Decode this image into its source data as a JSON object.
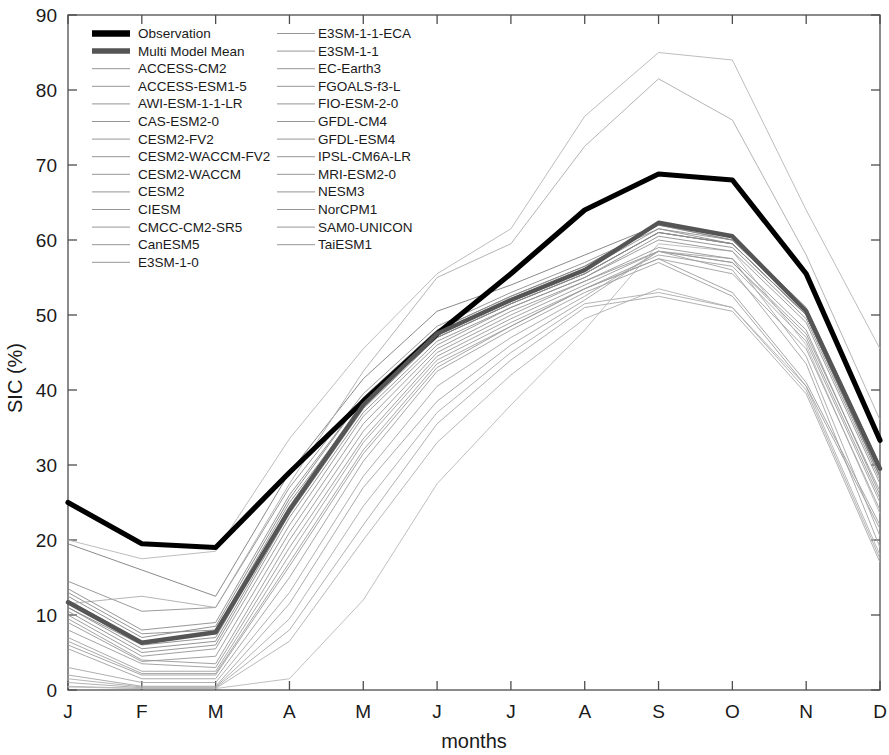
{
  "chart_data": {
    "type": "line",
    "title": "",
    "xlabel": "months",
    "ylabel": "SIC (%)",
    "categories": [
      "J",
      "F",
      "M",
      "A",
      "M",
      "J",
      "J",
      "A",
      "S",
      "O",
      "N",
      "D"
    ],
    "xtick_labels": [
      "J",
      "F",
      "M",
      "A",
      "M",
      "J",
      "J",
      "A",
      "S",
      "O",
      "N",
      "D"
    ],
    "ytick_labels": [
      "0",
      "10",
      "20",
      "30",
      "40",
      "50",
      "60",
      "70",
      "80",
      "90"
    ],
    "yticks": [
      0,
      10,
      20,
      30,
      40,
      50,
      60,
      70,
      80,
      90
    ],
    "ylim": [
      0,
      90
    ],
    "xlim": [
      0,
      11
    ],
    "grid": false,
    "legend_position": "upper-left-inside",
    "legend_columns": 2,
    "colors": {
      "observation": "#000000",
      "multi_model_mean": "#555555",
      "model_line": "#8a8a8a",
      "axis": "#4d4d4d",
      "background": "#ffffff"
    },
    "series": [
      {
        "name": "Observation",
        "kind": "observation",
        "color": "#000000",
        "width": 5.2,
        "values": [
          25.0,
          19.5,
          19.0,
          29.0,
          38.5,
          47.5,
          55.5,
          64.0,
          68.8,
          68.0,
          55.5,
          33.3
        ]
      },
      {
        "name": "Multi Model Mean",
        "kind": "mean",
        "color": "#555555",
        "width": 4.4,
        "values": [
          11.7,
          6.3,
          7.7,
          24.0,
          38.0,
          47.5,
          52.0,
          56.0,
          62.3,
          60.5,
          50.5,
          29.5
        ]
      },
      {
        "name": "ACCESS-CM2",
        "kind": "model",
        "color": "#7d7d7d",
        "width": 0.9,
        "values": [
          19.5,
          16.0,
          12.5,
          29.0,
          41.5,
          50.5,
          54.0,
          58.0,
          62.0,
          60.5,
          51.0,
          30.0
        ]
      },
      {
        "name": "ACCESS-ESM1-5",
        "kind": "model",
        "color": "#8f8f8f",
        "width": 0.9,
        "values": [
          14.5,
          10.5,
          11.0,
          27.0,
          39.5,
          48.5,
          53.0,
          57.0,
          61.5,
          59.5,
          50.0,
          28.5
        ]
      },
      {
        "name": "AWI-ESM-1-1-LR",
        "kind": "model",
        "color": "#999999",
        "width": 0.9,
        "values": [
          9.5,
          4.0,
          3.5,
          20.0,
          34.5,
          45.0,
          50.0,
          54.5,
          58.5,
          57.0,
          47.5,
          26.5
        ]
      },
      {
        "name": "CAS-ESM2-0",
        "kind": "model",
        "color": "#a3a3a3",
        "width": 0.9,
        "values": [
          2.0,
          0.5,
          0.5,
          11.5,
          27.0,
          38.5,
          46.0,
          52.0,
          58.5,
          56.0,
          43.5,
          19.0
        ]
      },
      {
        "name": "CESM2-FV2",
        "kind": "model",
        "color": "#8a8a8a",
        "width": 0.9,
        "values": [
          13.0,
          7.5,
          8.0,
          25.0,
          38.0,
          47.0,
          51.5,
          55.5,
          61.0,
          59.5,
          50.0,
          28.5
        ]
      },
      {
        "name": "CESM2-WACCM-FV2",
        "kind": "model",
        "color": "#909090",
        "width": 0.9,
        "values": [
          12.0,
          6.5,
          7.5,
          24.5,
          38.5,
          47.5,
          52.0,
          56.0,
          61.5,
          60.0,
          50.5,
          29.0
        ]
      },
      {
        "name": "CESM2-WACCM",
        "kind": "model",
        "color": "#878787",
        "width": 0.9,
        "values": [
          11.0,
          5.5,
          6.5,
          23.5,
          37.5,
          47.0,
          51.5,
          55.5,
          61.0,
          59.5,
          50.0,
          28.5
        ]
      },
      {
        "name": "CESM2",
        "kind": "model",
        "color": "#8d8d8d",
        "width": 0.9,
        "values": [
          10.5,
          5.0,
          6.0,
          23.0,
          37.0,
          46.5,
          51.0,
          55.0,
          60.5,
          59.0,
          49.5,
          28.0
        ]
      },
      {
        "name": "CIESM",
        "kind": "model",
        "color": "#9c9c9c",
        "width": 0.9,
        "values": [
          6.0,
          2.0,
          2.0,
          16.5,
          31.5,
          43.0,
          48.5,
          53.5,
          57.5,
          53.0,
          41.0,
          22.0
        ]
      },
      {
        "name": "CMCC-CM2-SR5",
        "kind": "model",
        "color": "#848484",
        "width": 0.9,
        "values": [
          12.5,
          7.0,
          8.5,
          25.5,
          39.0,
          48.0,
          52.5,
          56.5,
          62.0,
          60.0,
          50.5,
          29.5
        ]
      },
      {
        "name": "CanESM5",
        "kind": "model",
        "color": "#a8a8a8",
        "width": 0.9,
        "values": [
          1.0,
          0.3,
          0.3,
          8.0,
          22.0,
          35.5,
          44.0,
          51.0,
          52.5,
          50.5,
          39.5,
          17.0
        ]
      },
      {
        "name": "E3SM-1-0",
        "kind": "model",
        "color": "#b0b0b0",
        "width": 0.9,
        "values": [
          0.5,
          0.2,
          0.2,
          6.5,
          20.0,
          33.0,
          42.0,
          49.5,
          53.5,
          51.0,
          40.5,
          18.0
        ]
      },
      {
        "name": "E3SM-1-1-ECA",
        "kind": "model",
        "color": "#b5b5b5",
        "width": 0.9,
        "values": [
          20.0,
          17.5,
          18.5,
          33.5,
          45.5,
          55.5,
          61.5,
          76.5,
          85.0,
          84.0,
          64.0,
          45.5
        ]
      },
      {
        "name": "E3SM-1-1",
        "kind": "model",
        "color": "#acacac",
        "width": 0.9,
        "values": [
          11.5,
          12.5,
          11.0,
          27.5,
          42.5,
          55.0,
          59.5,
          72.5,
          81.5,
          76.0,
          58.0,
          36.0
        ]
      },
      {
        "name": "EC-Earth3",
        "kind": "model",
        "color": "#9a9a9a",
        "width": 0.9,
        "values": [
          8.0,
          3.5,
          3.0,
          19.0,
          33.5,
          44.5,
          49.5,
          54.0,
          58.5,
          57.0,
          47.0,
          25.5
        ]
      },
      {
        "name": "FGOALS-f3-L",
        "kind": "model",
        "color": "#a0a0a0",
        "width": 0.9,
        "values": [
          7.0,
          2.5,
          2.5,
          18.0,
          33.0,
          44.0,
          49.0,
          53.5,
          58.0,
          56.5,
          46.5,
          25.0
        ]
      },
      {
        "name": "FIO-ESM-2-0",
        "kind": "model",
        "color": "#b8b8b8",
        "width": 0.9,
        "values": [
          0.4,
          0.2,
          0.2,
          1.5,
          12.0,
          27.5,
          38.0,
          48.0,
          59.5,
          58.5,
          46.0,
          23.5
        ]
      },
      {
        "name": "GFDL-CM4",
        "kind": "model",
        "color": "#9e9e9e",
        "width": 0.9,
        "values": [
          5.5,
          1.5,
          1.5,
          15.0,
          30.5,
          42.5,
          48.0,
          53.0,
          57.0,
          52.5,
          40.5,
          21.5
        ]
      },
      {
        "name": "GFDL-ESM4",
        "kind": "model",
        "color": "#8b8b8b",
        "width": 0.9,
        "values": [
          13.5,
          8.0,
          9.0,
          26.0,
          39.0,
          48.0,
          52.5,
          56.5,
          62.0,
          60.0,
          50.5,
          29.5
        ]
      },
      {
        "name": "IPSL-CM6A-LR",
        "kind": "model",
        "color": "#949494",
        "width": 0.9,
        "values": [
          10.0,
          4.5,
          5.5,
          22.0,
          36.5,
          46.0,
          51.0,
          55.0,
          60.0,
          58.5,
          49.0,
          27.5
        ]
      },
      {
        "name": "MRI-ESM2-0",
        "kind": "model",
        "color": "#a6a6a6",
        "width": 0.9,
        "values": [
          3.0,
          1.0,
          1.0,
          13.0,
          28.5,
          40.5,
          47.0,
          52.5,
          58.5,
          57.5,
          44.5,
          20.5
        ]
      },
      {
        "name": "NESM3",
        "kind": "model",
        "color": "#ababab",
        "width": 0.9,
        "values": [
          1.5,
          0.4,
          0.4,
          9.5,
          24.5,
          37.0,
          45.0,
          51.5,
          53.0,
          51.0,
          40.0,
          17.5
        ]
      },
      {
        "name": "NorCPM1",
        "kind": "model",
        "color": "#898989",
        "width": 0.9,
        "values": [
          11.0,
          6.0,
          7.0,
          24.0,
          38.0,
          47.0,
          51.5,
          55.5,
          61.0,
          59.5,
          50.0,
          28.5
        ]
      },
      {
        "name": "SAM0-UNICON",
        "kind": "model",
        "color": "#9f9f9f",
        "width": 0.9,
        "values": [
          6.5,
          2.2,
          2.2,
          17.0,
          32.0,
          43.5,
          48.5,
          53.5,
          57.5,
          55.5,
          45.5,
          24.0
        ]
      },
      {
        "name": "TaiESM1",
        "kind": "model",
        "color": "#969696",
        "width": 0.9,
        "values": [
          9.0,
          3.8,
          4.5,
          21.0,
          35.5,
          45.5,
          50.5,
          54.5,
          59.0,
          57.5,
          48.0,
          26.0
        ]
      }
    ]
  },
  "legend": {
    "column1": [
      {
        "label": "Observation",
        "style": "thick-black"
      },
      {
        "label": "Multi Model Mean",
        "style": "thick-gray"
      },
      {
        "label": "ACCESS-CM2",
        "style": "thin"
      },
      {
        "label": "ACCESS-ESM1-5",
        "style": "thin"
      },
      {
        "label": "AWI-ESM-1-1-LR",
        "style": "thin"
      },
      {
        "label": "CAS-ESM2-0",
        "style": "thin"
      },
      {
        "label": "CESM2-FV2",
        "style": "thin"
      },
      {
        "label": "CESM2-WACCM-FV2",
        "style": "thin"
      },
      {
        "label": "CESM2-WACCM",
        "style": "thin"
      },
      {
        "label": "CESM2",
        "style": "thin"
      },
      {
        "label": "CIESM",
        "style": "thin"
      },
      {
        "label": "CMCC-CM2-SR5",
        "style": "thin"
      },
      {
        "label": "CanESM5",
        "style": "thin"
      },
      {
        "label": "E3SM-1-0",
        "style": "thin"
      }
    ],
    "column2": [
      {
        "label": "E3SM-1-1-ECA",
        "style": "thin"
      },
      {
        "label": "E3SM-1-1",
        "style": "thin"
      },
      {
        "label": "EC-Earth3",
        "style": "thin"
      },
      {
        "label": "FGOALS-f3-L",
        "style": "thin"
      },
      {
        "label": "FIO-ESM-2-0",
        "style": "thin"
      },
      {
        "label": "GFDL-CM4",
        "style": "thin"
      },
      {
        "label": "GFDL-ESM4",
        "style": "thin"
      },
      {
        "label": "IPSL-CM6A-LR",
        "style": "thin"
      },
      {
        "label": "MRI-ESM2-0",
        "style": "thin"
      },
      {
        "label": "NESM3",
        "style": "thin"
      },
      {
        "label": "NorCPM1",
        "style": "thin"
      },
      {
        "label": "SAM0-UNICON",
        "style": "thin"
      },
      {
        "label": "TaiESM1",
        "style": "thin"
      }
    ]
  }
}
